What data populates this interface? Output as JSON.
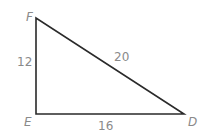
{
  "diagram": {
    "type": "right-triangle",
    "vertices": [
      {
        "name": "F",
        "x": 36,
        "y": 18
      },
      {
        "name": "E",
        "x": 36,
        "y": 114
      },
      {
        "name": "D",
        "x": 184,
        "y": 114
      }
    ],
    "sides": [
      {
        "between": "E-F",
        "length": "12"
      },
      {
        "between": "F-D",
        "length": "20"
      },
      {
        "between": "E-D",
        "length": "16"
      }
    ],
    "colors": {
      "stroke": "#2a2a2a",
      "label": "#8a8a8a"
    }
  }
}
